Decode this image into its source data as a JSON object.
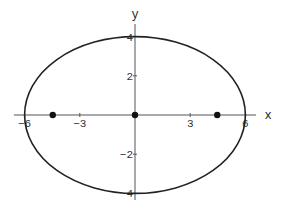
{
  "chart_data": {
    "type": "line",
    "title": "",
    "xlabel": "x",
    "ylabel": "y",
    "xlim": [
      -6.6,
      6.6
    ],
    "ylim": [
      -4.3,
      4.6
    ],
    "grid": false,
    "legend": null,
    "x_ticks": [
      {
        "value": -6,
        "label": "-6"
      },
      {
        "value": -3,
        "label": "-3"
      },
      {
        "value": 3,
        "label": "3"
      },
      {
        "value": 6,
        "label": "6"
      }
    ],
    "y_ticks": [
      {
        "value": 4,
        "label": "4"
      },
      {
        "value": 2,
        "label": "2"
      },
      {
        "value": -2,
        "label": "-2"
      },
      {
        "value": -4,
        "label": "4"
      }
    ],
    "series": [
      {
        "name": "ellipse",
        "kind": "curve",
        "equation": "x^2/36 + y^2/16 = 1",
        "semi_major_axis": 6,
        "semi_minor_axis": 4,
        "center": [
          0,
          0
        ],
        "color": "#222222"
      },
      {
        "name": "points",
        "kind": "scatter",
        "points": [
          {
            "label": "left-focus",
            "x": -4.47,
            "y": 0
          },
          {
            "label": "center",
            "x": 0,
            "y": 0
          },
          {
            "label": "right-focus",
            "x": 4.47,
            "y": 0
          }
        ],
        "color": "#111111"
      }
    ]
  },
  "layout": {
    "origin_px": [
      135,
      115
    ],
    "px_per_unit_x": 18.4,
    "px_per_unit_y": 19.6,
    "x_axis_px": [
      14,
      256
    ],
    "y_axis_px": [
      24,
      200
    ],
    "x_label_px": [
      268,
      119
    ],
    "y_label_px": [
      135,
      18
    ]
  }
}
